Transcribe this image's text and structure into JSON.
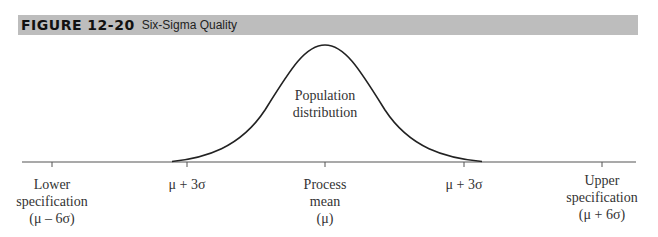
{
  "figure": {
    "number": "FIGURE 12-20",
    "title": "Six-Sigma Quality"
  },
  "curve_label": {
    "line1": "Population",
    "line2": "distribution"
  },
  "axis_labels": [
    {
      "id": "lower-spec",
      "lines": [
        "Lower",
        "specification",
        "(μ – 6σ)"
      ]
    },
    {
      "id": "minus-3sigma",
      "lines": [
        "μ + 3σ"
      ]
    },
    {
      "id": "process-mean",
      "lines": [
        "Process",
        "mean",
        "(μ)"
      ]
    },
    {
      "id": "plus-3sigma",
      "lines": [
        "μ + 3σ"
      ]
    },
    {
      "id": "upper-spec",
      "lines": [
        "Upper",
        "specification",
        "(μ + 6σ)"
      ]
    }
  ],
  "colors": {
    "header_bg": "#bdbdbd",
    "curve": "#222222",
    "axis": "#555555"
  }
}
